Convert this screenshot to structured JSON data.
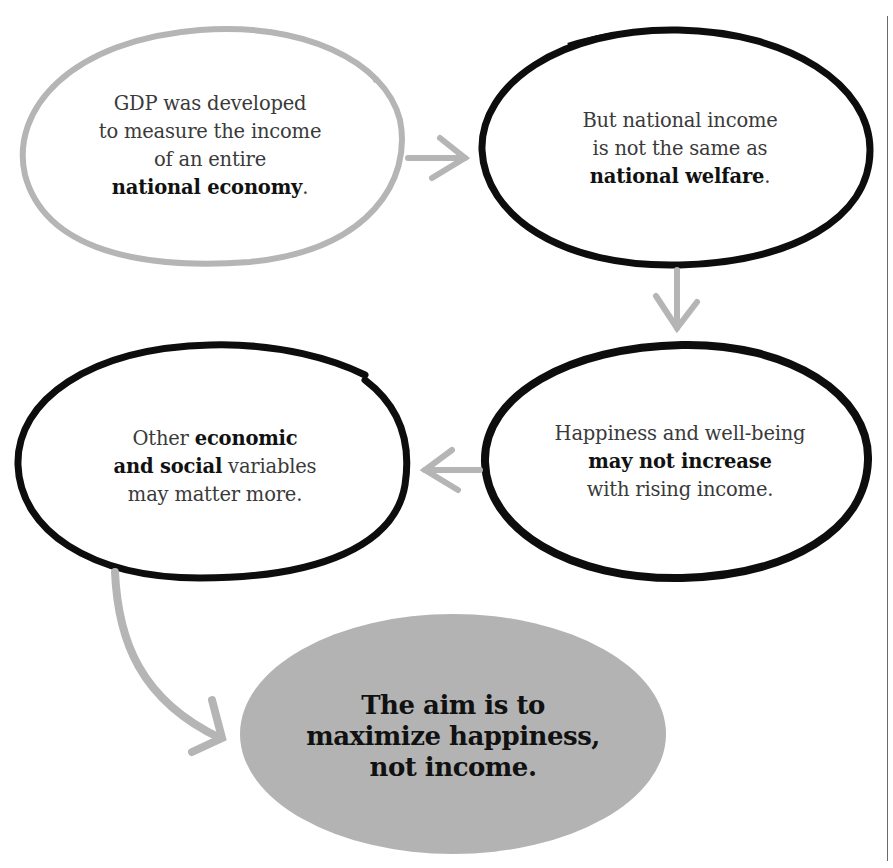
{
  "colors": {
    "background": "#ffffff",
    "gray_stroke": "#b5b5b5",
    "black_stroke": "#0d0d0d",
    "final_fill": "#b3b3b3",
    "text": "#3a3a3a",
    "bold_text": "#111111"
  },
  "nodes": [
    {
      "id": "gdp",
      "style": "gray-outline",
      "lines": [
        {
          "normal": "GDP was developed"
        },
        {
          "normal": "to measure the income"
        },
        {
          "normal": "of an entire"
        },
        {
          "bold": "national economy",
          "suffix": "."
        }
      ]
    },
    {
      "id": "income-vs-welfare",
      "style": "black-outline",
      "lines": [
        {
          "normal": "But national income"
        },
        {
          "normal": "is not the same as"
        },
        {
          "bold": "national welfare",
          "suffix": "."
        }
      ]
    },
    {
      "id": "happiness",
      "style": "black-outline",
      "lines": [
        {
          "normal": "Happiness and well-being"
        },
        {
          "bold": "may not increase"
        },
        {
          "normal": "with rising income."
        }
      ]
    },
    {
      "id": "other-variables",
      "style": "black-outline",
      "lines": [
        {
          "prefix": "Other ",
          "bold": "economic"
        },
        {
          "bold": "and social",
          "suffix": " variables"
        },
        {
          "normal": "may matter more."
        }
      ]
    },
    {
      "id": "aim",
      "style": "gray-filled",
      "lines": [
        {
          "bold": "The aim is to"
        },
        {
          "bold": "maximize happiness,"
        },
        {
          "bold": "not income."
        }
      ]
    }
  ],
  "edges": [
    {
      "from": "gdp",
      "to": "income-vs-welfare",
      "direction": "right"
    },
    {
      "from": "income-vs-welfare",
      "to": "happiness",
      "direction": "down"
    },
    {
      "from": "happiness",
      "to": "other-variables",
      "direction": "left"
    },
    {
      "from": "other-variables",
      "to": "aim",
      "direction": "curved-down-right"
    }
  ],
  "text": {
    "n0": {
      "l0": "GDP was developed",
      "l1": "to measure the income",
      "l2": "of an entire",
      "l3b": "national economy",
      "l3s": "."
    },
    "n1": {
      "l0": "But national income",
      "l1": "is not the same as",
      "l2b": "national welfare",
      "l2s": "."
    },
    "n2": {
      "l0": "Happiness and well-being",
      "l1b": "may not increase",
      "l2": "with rising income."
    },
    "n3": {
      "l0p": "Other ",
      "l0b": "economic",
      "l1b": "and social",
      "l1s": " variables",
      "l2": "may matter more."
    },
    "n4": {
      "l0": "The aim is to",
      "l1": "maximize happiness,",
      "l2": "not income."
    }
  }
}
